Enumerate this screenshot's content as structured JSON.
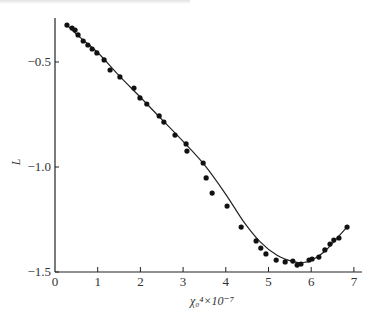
{
  "chart_data": {
    "type": "scatter",
    "title": "",
    "xlabel": "χ₀⁴×10⁻⁷",
    "ylabel": "L",
    "xlim": [
      0,
      7
    ],
    "ylim": [
      -1.5,
      -0.3
    ],
    "xticks": [
      0,
      1,
      2,
      3,
      4,
      5,
      6,
      7
    ],
    "xtick_labels": [
      "0",
      "1",
      "2",
      "3",
      "4",
      "5",
      "6",
      "7"
    ],
    "yticks": [
      -0.5,
      -1.0,
      -1.5
    ],
    "ytick_labels": [
      "-0.5",
      "-1.0",
      "-1.5"
    ],
    "grid": false,
    "legend": null,
    "series": [
      {
        "name": "measured",
        "style": "filled-circle-markers",
        "x": [
          0.28,
          0.4,
          0.47,
          0.54,
          0.66,
          0.77,
          0.87,
          0.98,
          1.15,
          1.29,
          1.52,
          1.85,
          1.99,
          2.15,
          2.44,
          2.55,
          2.81,
          3.07,
          3.09,
          3.47,
          3.54,
          3.68,
          4.03,
          4.36,
          4.71,
          4.82,
          4.94,
          5.18,
          5.39,
          5.57,
          5.67,
          5.76,
          5.95,
          6.02,
          6.18,
          6.32,
          6.44,
          6.53,
          6.65,
          6.84
        ],
        "y": [
          -0.324,
          -0.338,
          -0.348,
          -0.371,
          -0.4,
          -0.419,
          -0.438,
          -0.457,
          -0.49,
          -0.538,
          -0.571,
          -0.624,
          -0.671,
          -0.7,
          -0.757,
          -0.786,
          -0.848,
          -0.89,
          -0.924,
          -0.981,
          -1.052,
          -1.124,
          -1.186,
          -1.286,
          -1.352,
          -1.386,
          -1.414,
          -1.443,
          -1.452,
          -1.448,
          -1.467,
          -1.462,
          -1.443,
          -1.438,
          -1.429,
          -1.395,
          -1.367,
          -1.348,
          -1.338,
          -1.286
        ]
      },
      {
        "name": "fit",
        "style": "solid-line",
        "x": [
          0.28,
          0.6,
          1.0,
          1.5,
          2.0,
          2.5,
          3.0,
          3.5,
          4.0,
          4.4,
          4.8,
          5.2,
          5.6,
          5.8,
          6.0,
          6.3,
          6.6,
          6.84
        ],
        "y": [
          -0.324,
          -0.385,
          -0.455,
          -0.565,
          -0.668,
          -0.773,
          -0.878,
          -0.99,
          -1.13,
          -1.255,
          -1.355,
          -1.42,
          -1.452,
          -1.455,
          -1.445,
          -1.405,
          -1.34,
          -1.286
        ]
      }
    ]
  },
  "page": {
    "cropped_caption_visible": true
  }
}
